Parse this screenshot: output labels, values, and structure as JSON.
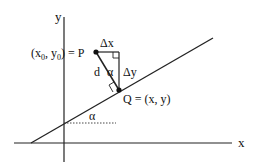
{
  "diagram": {
    "type": "geometry",
    "axes": {
      "x_label": "x",
      "y_label": "y"
    },
    "points": {
      "P_label": "(x",
      "P_sub0": "0",
      "P_mid": ", y",
      "P_sub1": "0",
      "P_end": ") = P",
      "Q_label": "Q = (x, y)"
    },
    "segment_labels": {
      "dx": "Δx",
      "dy": "Δy",
      "d": "d",
      "alpha_triangle": "α",
      "alpha_line": "α"
    },
    "colors": {
      "stroke": "#222222",
      "background": "#ffffff"
    }
  }
}
